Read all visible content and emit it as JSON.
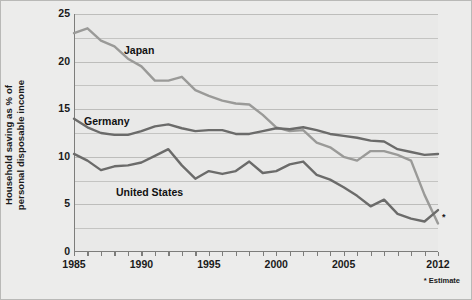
{
  "figure": {
    "background_color": "#ececeb",
    "plot_background_color": "#e9e9e8",
    "ylabel_line1": "Household saving as % of",
    "ylabel_line2": "personal disposable income",
    "footnote": "* Estimate",
    "estimate_marker": "*"
  },
  "chart_data": {
    "type": "line",
    "title": "",
    "xlabel": "",
    "ylabel": "Household saving as % of personal disposable income",
    "xlim": [
      1985,
      2012
    ],
    "ylim": [
      0,
      25
    ],
    "yticks": [
      0,
      5,
      10,
      15,
      20,
      25
    ],
    "ytick_labels": [
      "0",
      "5",
      "10",
      "15",
      "20",
      "25"
    ],
    "y_minor_gridlines": [
      2.5,
      7.5,
      12.5,
      17.5,
      22.5
    ],
    "xticks": [
      1985,
      1990,
      1995,
      2000,
      2005,
      2012
    ],
    "xtick_labels": [
      "1985",
      "1990",
      "1995",
      "2000",
      "2005",
      "2012"
    ],
    "x_minor_ticks_every": 1,
    "grid": "horizontal",
    "legend": "inline-labels",
    "x": [
      1985,
      1986,
      1987,
      1988,
      1989,
      1990,
      1991,
      1992,
      1993,
      1994,
      1995,
      1996,
      1997,
      1998,
      1999,
      2000,
      2001,
      2002,
      2003,
      2004,
      2005,
      2006,
      2007,
      2008,
      2009,
      2010,
      2011,
      2012
    ],
    "series": [
      {
        "name": "Japan",
        "color": "#9a9a98",
        "label_x": 1992,
        "values": [
          23.0,
          23.5,
          22.2,
          21.6,
          20.3,
          19.5,
          18.0,
          18.0,
          18.4,
          17.0,
          16.4,
          15.9,
          15.6,
          15.5,
          14.4,
          13.1,
          12.7,
          12.8,
          11.5,
          11.0,
          10.0,
          9.6,
          10.6,
          10.6,
          10.2,
          9.6,
          6.0,
          3.0
        ],
        "last_point_estimate": true
      },
      {
        "name": "Germany",
        "color": "#6b6b6a",
        "label_x": 1986,
        "values": [
          14.0,
          13.1,
          12.5,
          12.3,
          12.3,
          12.7,
          13.2,
          13.4,
          13.0,
          12.7,
          12.8,
          12.8,
          12.4,
          12.4,
          12.7,
          13.0,
          12.9,
          13.1,
          12.8,
          12.4,
          12.2,
          12.0,
          11.7,
          11.6,
          10.8,
          10.5,
          10.2,
          10.3
        ]
      },
      {
        "name": "United States",
        "color": "#6b6b6a",
        "label_x": 1990,
        "values": [
          10.3,
          9.6,
          8.6,
          9.0,
          9.1,
          9.4,
          10.1,
          10.8,
          9.1,
          7.7,
          8.5,
          8.2,
          8.5,
          9.5,
          8.3,
          8.5,
          9.2,
          9.5,
          8.1,
          7.6,
          6.8,
          5.9,
          4.8,
          5.5,
          4.0,
          3.5,
          3.2,
          4.4
        ]
      }
    ]
  }
}
